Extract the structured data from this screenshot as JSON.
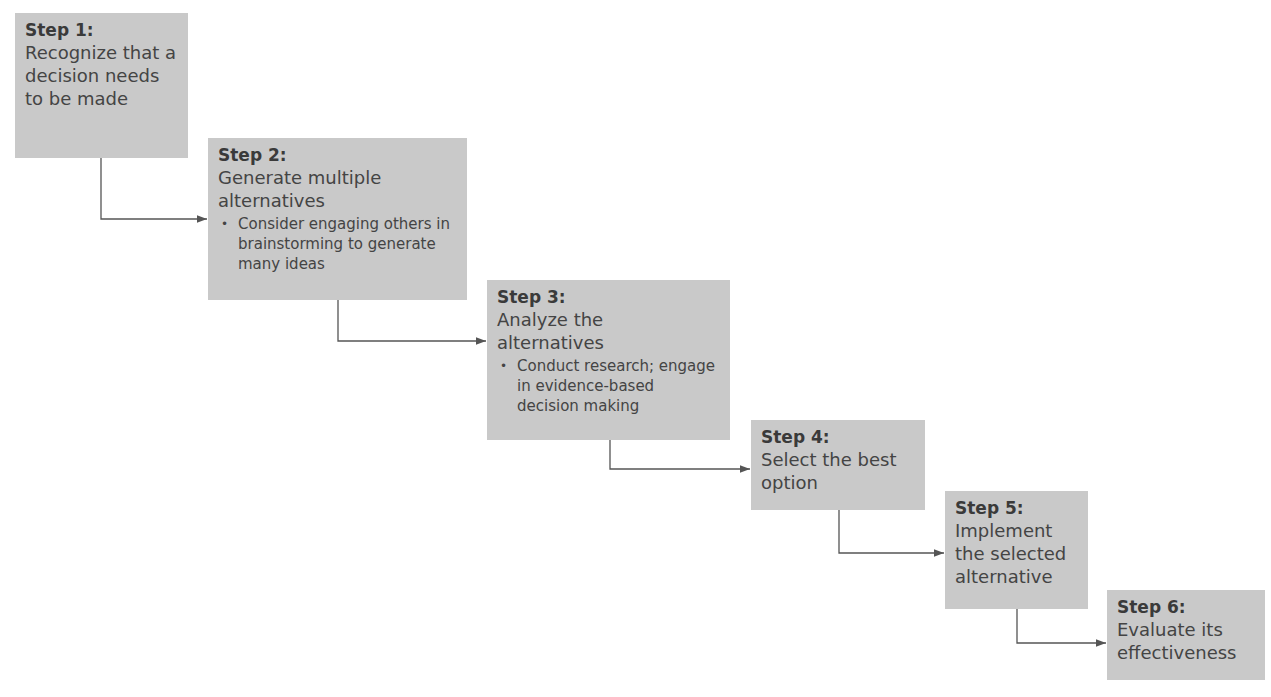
{
  "diagram": {
    "type": "staircase-flow",
    "colors": {
      "box_fill": "#c9c9c9",
      "text": "#404040",
      "connector": "#555555"
    },
    "steps": [
      {
        "label": "Step 1:",
        "text": "Recognize that a decision needs to be made",
        "bullets": []
      },
      {
        "label": "Step 2:",
        "text": "Generate multiple alternatives",
        "bullets": [
          "Consider engaging others in  brainstorming to generate many ideas"
        ]
      },
      {
        "label": "Step 3:",
        "text": "Analyze the alternatives",
        "bullets": [
          "Conduct research; engage in evidence-based decision making"
        ]
      },
      {
        "label": "Step 4:",
        "text": "Select the best option",
        "bullets": []
      },
      {
        "label": "Step 5:",
        "text": "Implement the selected alternative",
        "bullets": []
      },
      {
        "label": "Step 6:",
        "text": "Evaluate its effectiveness",
        "bullets": []
      }
    ]
  }
}
